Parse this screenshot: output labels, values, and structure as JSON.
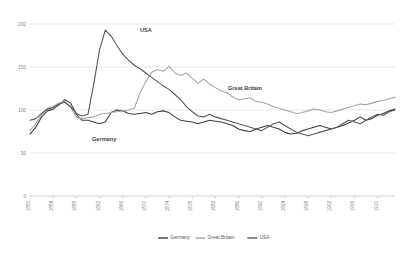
{
  "chart_data": {
    "type": "line",
    "title": "",
    "xlabel": "",
    "ylabel": "",
    "ylim": [
      0,
      200
    ],
    "yticks": [
      0,
      50,
      100,
      150,
      200
    ],
    "grid": true,
    "legend_position": "bottom",
    "x": [
      1850,
      1851,
      1852,
      1853,
      1854,
      1855,
      1856,
      1857,
      1858,
      1859,
      1860,
      1861,
      1862,
      1863,
      1864,
      1865,
      1866,
      1867,
      1868,
      1869,
      1870,
      1871,
      1872,
      1873,
      1874,
      1875,
      1876,
      1877,
      1878,
      1879,
      1880,
      1881,
      1882,
      1883,
      1884,
      1885,
      1886,
      1887,
      1888,
      1889,
      1890,
      1891,
      1892,
      1893,
      1894,
      1895,
      1896,
      1897,
      1898,
      1899,
      1900,
      1901,
      1902,
      1903,
      1904,
      1905,
      1906,
      1907,
      1908,
      1909,
      1910,
      1911,
      1912,
      1913
    ],
    "xtick_labels": [
      "1850",
      "1854",
      "1858",
      "1862",
      "1866",
      "1870",
      "1874",
      "1878",
      "1882",
      "1886",
      "1890",
      "1894",
      "1898",
      "1902",
      "1906",
      "1910"
    ],
    "series": [
      {
        "name": "Germany",
        "color": "#404040",
        "values": [
          72,
          80,
          92,
          99,
          101,
          106,
          112,
          108,
          95,
          88,
          88,
          86,
          84,
          86,
          97,
          100,
          99,
          96,
          95,
          96,
          97,
          95,
          98,
          99,
          97,
          92,
          88,
          87,
          86,
          84,
          86,
          88,
          87,
          86,
          84,
          82,
          78,
          76,
          75,
          78,
          80,
          82,
          80,
          78,
          74,
          72,
          73,
          76,
          78,
          80,
          82,
          80,
          78,
          80,
          82,
          85,
          88,
          92,
          88,
          90,
          94,
          96,
          99,
          101
        ]
      },
      {
        "name": "Great Britain",
        "color": "#a6a6a6",
        "values": [
          76,
          84,
          95,
          102,
          104,
          108,
          110,
          103,
          92,
          90,
          91,
          92,
          95,
          96,
          97,
          98,
          99,
          100,
          102,
          120,
          133,
          144,
          147,
          145,
          151,
          143,
          140,
          143,
          137,
          131,
          136,
          130,
          126,
          122,
          120,
          115,
          112,
          113,
          114,
          110,
          109,
          107,
          104,
          102,
          100,
          98,
          96,
          97,
          99,
          101,
          100,
          98,
          97,
          99,
          101,
          103,
          105,
          107,
          106,
          108,
          110,
          111,
          113,
          115
        ]
      },
      {
        "name": "USA",
        "color": "#595959",
        "values": [
          88,
          90,
          96,
          101,
          103,
          107,
          109,
          104,
          96,
          93,
          95,
          130,
          170,
          193,
          186,
          175,
          165,
          158,
          152,
          148,
          143,
          138,
          133,
          128,
          124,
          118,
          112,
          104,
          98,
          93,
          92,
          95,
          92,
          90,
          88,
          86,
          84,
          82,
          80,
          78,
          76,
          80,
          84,
          86,
          82,
          78,
          74,
          72,
          70,
          72,
          74,
          76,
          78,
          80,
          84,
          88,
          86,
          84,
          88,
          92,
          95,
          94,
          98,
          100
        ]
      }
    ],
    "annotations": [
      {
        "label": "USA",
        "x": 140,
        "y": 32
      },
      {
        "label": "Great Britain",
        "x": 228,
        "y": 90
      },
      {
        "label": "Germany",
        "x": 92,
        "y": 141
      }
    ]
  },
  "legend": {
    "items": [
      {
        "label": "Germany",
        "color": "#404040"
      },
      {
        "label": "Great Britain",
        "color": "#a6a6a6"
      },
      {
        "label": "USA",
        "color": "#595959"
      }
    ]
  }
}
